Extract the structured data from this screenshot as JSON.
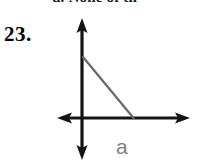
{
  "page": {
    "width": 199,
    "height": 165,
    "background": "#ffffff"
  },
  "clipped_header": {
    "text": "d. None of th",
    "note": "partially cropped line of text at top edge"
  },
  "problem": {
    "number_label": "23."
  },
  "figure": {
    "type": "coordinate-axes-with-right-triangle",
    "colors": {
      "axis": "#141414",
      "hypotenuse": "#6b6b6b",
      "label": "#7d7d7d"
    },
    "axes": {
      "vertical": {
        "x": 82,
        "y_top": 18,
        "y_bottom": 160,
        "arrowheads": [
          "up",
          "down"
        ],
        "stroke_width": 3
      },
      "horizontal": {
        "y": 118,
        "x_left": 57,
        "x_right": 190,
        "arrowheads": [
          "left",
          "right"
        ],
        "stroke_width": 3
      }
    },
    "triangle": {
      "vertices": {
        "top": [
          83,
          57
        ],
        "origin": [
          83,
          118
        ],
        "right": [
          133,
          118
        ]
      },
      "hypotenuse": {
        "from": [
          83,
          57
        ],
        "to": [
          133,
          118
        ],
        "stroke_width": 2.2
      },
      "legs_drawn_on_axes": true
    },
    "labels": [
      {
        "text": "a",
        "name": "side-label-a",
        "x": 118,
        "y": 140
      }
    ]
  }
}
